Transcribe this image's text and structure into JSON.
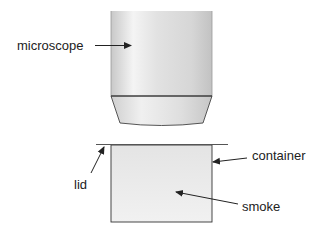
{
  "diagram": {
    "type": "labelled-apparatus",
    "labels": {
      "microscope": "microscope",
      "container": "container",
      "lid": "lid",
      "smoke": "smoke"
    },
    "colors": {
      "stroke": "#333333",
      "tube_light": "#f2f2f2",
      "tube_mid": "#dcdcdc",
      "tube_dark": "#c4c4c4",
      "container_fill": "#ebebeb",
      "lid": "#555555",
      "text": "#222222"
    }
  }
}
